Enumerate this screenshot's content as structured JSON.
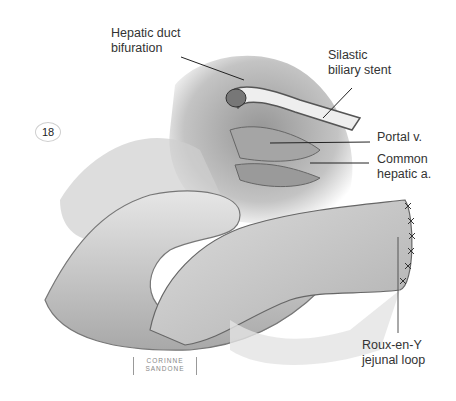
{
  "figure": {
    "number": "18",
    "artist_signature": "CORINNE\nSANDONE",
    "labels": [
      {
        "id": "hepatic-duct-bifuration",
        "text": "Hepatic duct\nbifuration"
      },
      {
        "id": "silastic-biliary-stent",
        "text": "Silastic\nbiliary stent"
      },
      {
        "id": "portal-vein",
        "text": "Portal v."
      },
      {
        "id": "common-hepatic-artery",
        "text": "Common\nhepatic a."
      },
      {
        "id": "roux-en-y-jejunal-loop",
        "text": "Roux-en-Y\njejunal loop"
      }
    ]
  }
}
